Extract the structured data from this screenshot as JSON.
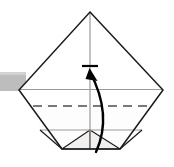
{
  "figure": {
    "type": "origami-instruction-diagram",
    "width": 174,
    "height": 167,
    "background_color": "#ffffff",
    "caption": ""
  },
  "colors": {
    "outline": "#1a1a1a",
    "crease_gray": "#9a9a9a",
    "dashed_crease": "#4d4d4d",
    "arrow": "#000000",
    "paper_fill": "#ffffff",
    "flap_fill": "#f2f0ef",
    "tab_gray": "#bdbdbd",
    "tab_gray_edge": "#d2d2d2"
  },
  "shapes": {
    "diamond": {
      "name": "folded-paper-diamond",
      "points": "90,12 163,90 120,149 62,149 19,90",
      "description": "Main folded paper silhouette, kite/diamond outline"
    },
    "diamond_outline_points": "90,12 163,90 120,149 62,149 19,90",
    "vertical_center_crease": {
      "x": 90,
      "y1": 12,
      "y2": 149
    },
    "horizontal_crease_upper": {
      "y": 89,
      "x1": 19,
      "x2": 163
    },
    "horizontal_crease_lower": {
      "y": 130,
      "x1": 40,
      "x2": 142
    },
    "dashed_crease_line": {
      "y": 106,
      "x1": 33,
      "x2": 148
    },
    "left_flap_triangle": "62,149 90,130 90,149",
    "right_flap_triangle": "120,149 90,130 90,149",
    "left_outer_fold": "62,149 40,130",
    "right_outer_fold": "120,149 142,130",
    "side_tab": {
      "x": 0,
      "y": 72,
      "width": 26,
      "height": 19
    }
  },
  "arrow": {
    "name": "fold-direction-arrow",
    "label": "",
    "path": "M 96,152 C 106,130 107,104 90,72",
    "head_points": "90,69 97,80 87,79",
    "tick_bar": {
      "x1": 82,
      "x2": 98,
      "y": 66
    },
    "direction": "upward-fold",
    "stroke_width": 2.4
  },
  "annotations": {
    "crease_style_solid": "existing fold / edge",
    "crease_style_dashed": "valley fold line",
    "arrow_meaning": "fold bottom point upward"
  }
}
